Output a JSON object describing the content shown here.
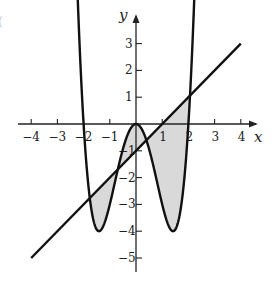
{
  "chart_data": {
    "type": "line",
    "title": "",
    "xlabel": "x",
    "ylabel": "y",
    "xlim": [
      -4.2,
      4.6
    ],
    "ylim": [
      -5.4,
      4.0
    ],
    "x_ticks": [
      -4,
      -3,
      -2,
      -1,
      1,
      2,
      3,
      4
    ],
    "y_ticks": [
      3,
      2,
      1,
      -1,
      -2,
      -3,
      -4,
      -5
    ],
    "grid": false,
    "legend": null,
    "series": [
      {
        "name": "curve",
        "expression": "y = x^4 - 4x^2",
        "x_range": [
          -2.25,
          2.25
        ],
        "key_points": [
          {
            "x": -2,
            "y": 0
          },
          {
            "x": -1.414,
            "y": -4
          },
          {
            "x": 0,
            "y": 0
          },
          {
            "x": 1.414,
            "y": -4
          },
          {
            "x": 2,
            "y": 0
          }
        ],
        "color": "#111111"
      },
      {
        "name": "line",
        "expression": "y = x - 1",
        "x_range": [
          -4,
          4
        ],
        "key_points": [
          {
            "x": -4,
            "y": -5
          },
          {
            "x": 1,
            "y": 0
          },
          {
            "x": 4,
            "y": 3
          }
        ],
        "color": "#111111"
      }
    ],
    "shaded_regions": [
      {
        "description": "between curve and line, left lobe",
        "x_range": [
          -1.71,
          -1.0
        ],
        "fill": "#d9d9d9"
      },
      {
        "description": "between curve and line, central region",
        "x_range": [
          -1.0,
          0.0
        ],
        "fill": "#d9d9d9"
      },
      {
        "description": "between curve and line, right region",
        "x_range": [
          0.0,
          2.08
        ],
        "fill": "#d9d9d9"
      }
    ],
    "intersections": [
      {
        "x": -1.71,
        "y": -2.71
      },
      {
        "x": -1.0,
        "y": -3.0
      },
      {
        "x": 0.27,
        "y": -0.73
      },
      {
        "x": 2.08,
        "y": 1.08
      }
    ]
  },
  "labels": {
    "x_axis": "x",
    "y_axis": "y",
    "x_ticks": [
      "−4",
      "−3",
      "−2",
      "−1",
      "1",
      "2",
      "3",
      "4"
    ],
    "y_ticks": [
      "3",
      "2",
      "1",
      "−1",
      "−2",
      "−3",
      "−4",
      "−5"
    ],
    "edge_mark": "("
  }
}
